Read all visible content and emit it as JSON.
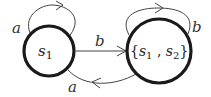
{
  "diagram": {
    "type": "state-transition-automaton",
    "nodes": [
      {
        "id": "s1",
        "label": "s",
        "subscript": "1",
        "full_label": "s1"
      },
      {
        "id": "s1s2",
        "label_parts": [
          "{",
          "s",
          "1",
          " , ",
          "s",
          "2",
          "}"
        ],
        "full_label": "{s1, s2}"
      }
    ],
    "edges": [
      {
        "from": "s1",
        "to": "s1",
        "label": "a",
        "kind": "self-loop"
      },
      {
        "from": "s1",
        "to": "s1s2",
        "label": "b",
        "kind": "straight"
      },
      {
        "from": "s1s2",
        "to": "s1s2",
        "label": "b",
        "kind": "self-loop"
      },
      {
        "from": "s1s2",
        "to": "s1",
        "label": "a",
        "kind": "curved"
      }
    ]
  }
}
